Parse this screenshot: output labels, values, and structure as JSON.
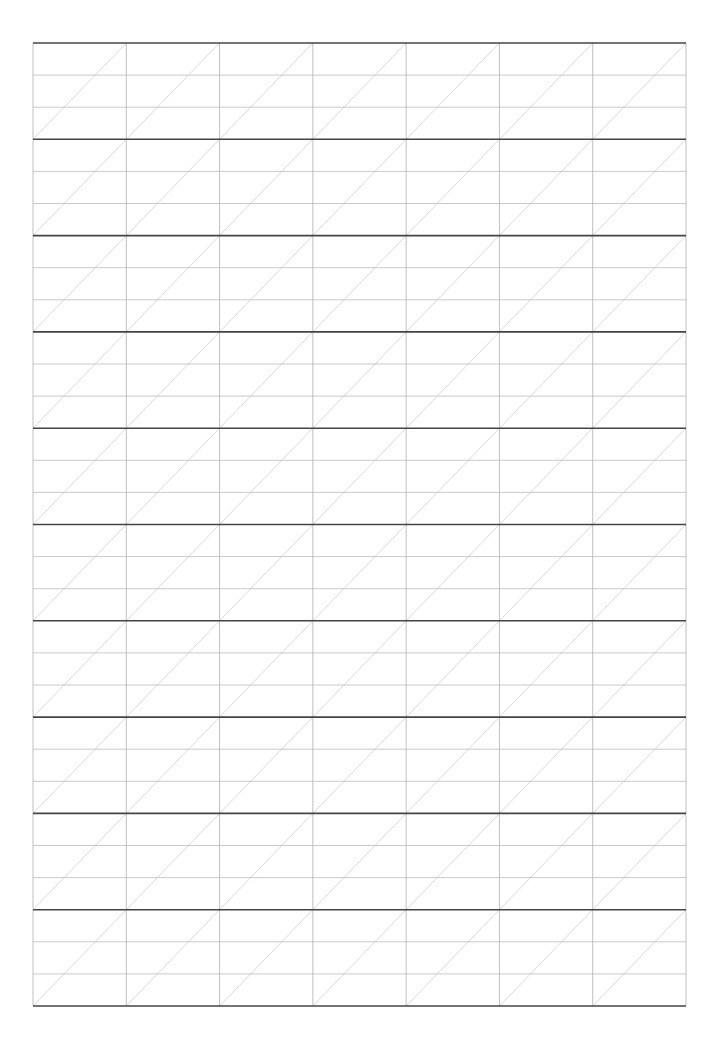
{
  "sheet": {
    "type": "practice-grid",
    "left": 33,
    "top": 43,
    "right": 686,
    "bottom": 1006,
    "columns": 7,
    "bands": 10,
    "subrows_per_band": 3,
    "diagonals": "bottom-left-to-top-right per cell",
    "colors": {
      "band_line": "#444444",
      "sub_line": "#bdbdbd",
      "column_line": "#b0b0b0",
      "diagonal": "#cfcfcf",
      "background": "#ffffff"
    }
  }
}
